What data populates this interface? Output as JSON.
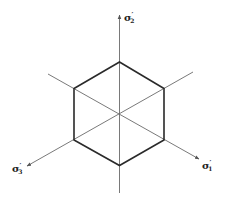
{
  "diagram": {
    "type": "deviatoric-plane-hexagon",
    "colors": {
      "axis": "#6a6a6a",
      "hexagon": "#2a2a2a",
      "label": "#222222"
    },
    "axes": [
      {
        "id": "sigma2",
        "symbol": "σ",
        "prime": "′",
        "subscript": "2",
        "direction": "up"
      },
      {
        "id": "sigma1",
        "symbol": "σ",
        "prime": "′",
        "subscript": "1",
        "direction": "lower-right"
      },
      {
        "id": "sigma3",
        "symbol": "σ",
        "prime": "′",
        "subscript": "3",
        "direction": "lower-left"
      }
    ]
  }
}
